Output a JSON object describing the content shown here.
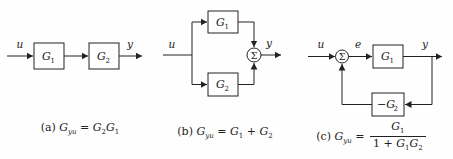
{
  "figure": {
    "background": "#fefefe",
    "ink": "#222222"
  },
  "a": {
    "u": "u",
    "y": "y",
    "g1": {
      "main": "G",
      "sub": "1"
    },
    "g2": {
      "main": "G",
      "sub": "2"
    },
    "caption": [
      {
        "t": "(a) ",
        "k": "lbl"
      },
      {
        "t": "G",
        "sub": "yu",
        "k": "var"
      },
      {
        "t": " = ",
        "k": "op"
      },
      {
        "t": "G",
        "sub": "2",
        "k": "var"
      },
      {
        "t": "G",
        "sub": "1",
        "k": "var"
      }
    ]
  },
  "b": {
    "u": "u",
    "y": "y",
    "summer": "Σ",
    "g1": {
      "main": "G",
      "sub": "1"
    },
    "g2": {
      "main": "G",
      "sub": "2"
    },
    "caption": [
      {
        "t": "(b) ",
        "k": "lbl"
      },
      {
        "t": "G",
        "sub": "yu",
        "k": "var"
      },
      {
        "t": " = ",
        "k": "op"
      },
      {
        "t": "G",
        "sub": "1",
        "k": "var"
      },
      {
        "t": " + ",
        "k": "op"
      },
      {
        "t": "G",
        "sub": "2",
        "k": "var"
      }
    ]
  },
  "c": {
    "u": "u",
    "e": "e",
    "y": "y",
    "summer": "Σ",
    "g1": {
      "main": "G",
      "sub": "1"
    },
    "g2": {
      "main": "−G",
      "sub": "2"
    },
    "caption": [
      {
        "t": "(c) ",
        "k": "lbl"
      },
      {
        "t": "G",
        "sub": "yu",
        "k": "var"
      },
      {
        "t": " = ",
        "k": "op"
      },
      {
        "k": "frac",
        "num": [
          {
            "t": "G",
            "sub": "1",
            "k": "var"
          }
        ],
        "den": [
          {
            "t": "1 + ",
            "k": "op"
          },
          {
            "t": "G",
            "sub": "1",
            "k": "var"
          },
          {
            "t": "G",
            "sub": "2",
            "k": "var"
          }
        ]
      }
    ]
  }
}
